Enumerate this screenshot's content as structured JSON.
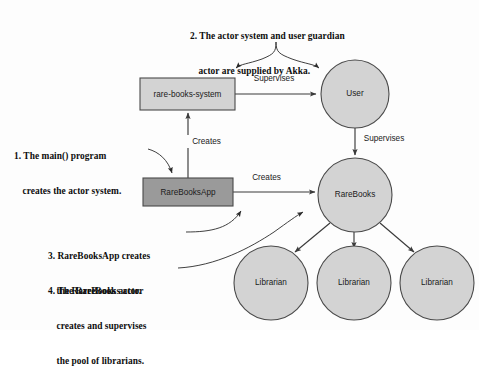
{
  "diagram": {
    "title_absent": true,
    "background_color": "#fdfdfd",
    "nodes": [
      {
        "id": "rare-books-system",
        "label": "rare-books-system",
        "shape": "rectangle",
        "fill": "#d3d3d3",
        "x": 140,
        "y": 78,
        "w": 95,
        "h": 32
      },
      {
        "id": "rarebooksapp",
        "label": "RareBooksApp",
        "shape": "rectangle",
        "fill": "#9a9a9a",
        "x": 143,
        "y": 178,
        "w": 90,
        "h": 28
      },
      {
        "id": "user",
        "label": "User",
        "shape": "circle",
        "fill": "#d3d3d3",
        "cx": 355,
        "cy": 94,
        "r": 34
      },
      {
        "id": "rarebooks",
        "label": "RareBooks",
        "shape": "circle",
        "fill": "#d3d3d3",
        "cx": 355,
        "cy": 195,
        "r": 37
      },
      {
        "id": "librarian-1",
        "label": "Librarian",
        "shape": "circle",
        "fill": "#d3d3d3",
        "cx": 271,
        "cy": 283,
        "r": 37
      },
      {
        "id": "librarian-2",
        "label": "Librarian",
        "shape": "circle",
        "fill": "#d3d3d3",
        "cx": 354,
        "cy": 283,
        "r": 37
      },
      {
        "id": "librarian-3",
        "label": "Librarian",
        "shape": "circle",
        "fill": "#d3d3d3",
        "cx": 437,
        "cy": 283,
        "r": 37
      }
    ],
    "edges": [
      {
        "id": "edge-supervises-user",
        "label": "Supervises",
        "from": "rare-books-system",
        "to": "user",
        "label_x": 274,
        "label_y": 79
      },
      {
        "id": "edge-supervises-rarebooks",
        "label": "Supervises",
        "from": "user",
        "to": "rarebooks",
        "label_x": 384,
        "label_y": 139
      },
      {
        "id": "edge-creates-system",
        "label": "Creates",
        "from": "rarebooksapp",
        "to": "rare-books-system",
        "label_x": 206,
        "label_y": 142
      },
      {
        "id": "edge-creates-rarebooks",
        "label": "Creates",
        "from": "rarebooksapp",
        "to": "rarebooks",
        "label_x": 266,
        "label_y": 178
      },
      {
        "id": "edge-rarebooks-librarian-1",
        "label": "",
        "from": "rarebooks",
        "to": "librarian-1"
      },
      {
        "id": "edge-rarebooks-librarian-2",
        "label": "",
        "from": "rarebooks",
        "to": "librarian-2"
      },
      {
        "id": "edge-rarebooks-librarian-3",
        "label": "",
        "from": "rarebooks",
        "to": "librarian-3"
      }
    ],
    "annotations": [
      {
        "id": "annotation-1",
        "number": "1.",
        "line1": "1. The main() program",
        "line2": "creates the actor system.",
        "points_to": "rarebooksapp"
      },
      {
        "id": "annotation-2",
        "number": "2.",
        "line1": "2. The actor system and user guardian",
        "line2": "actor are supplied by Akka.",
        "points_to": "rare-books-system and user"
      },
      {
        "id": "annotation-3",
        "number": "3.",
        "line1": "3. RareBooksApp creates",
        "line2": "the RareBooks actor.",
        "points_to": "rarebooksapp"
      },
      {
        "id": "annotation-4",
        "number": "4.",
        "line1": "4. The RareBooks actor",
        "line2": "creates and supervises",
        "line3": "the pool of librarians.",
        "points_to": "rarebooks"
      }
    ]
  }
}
